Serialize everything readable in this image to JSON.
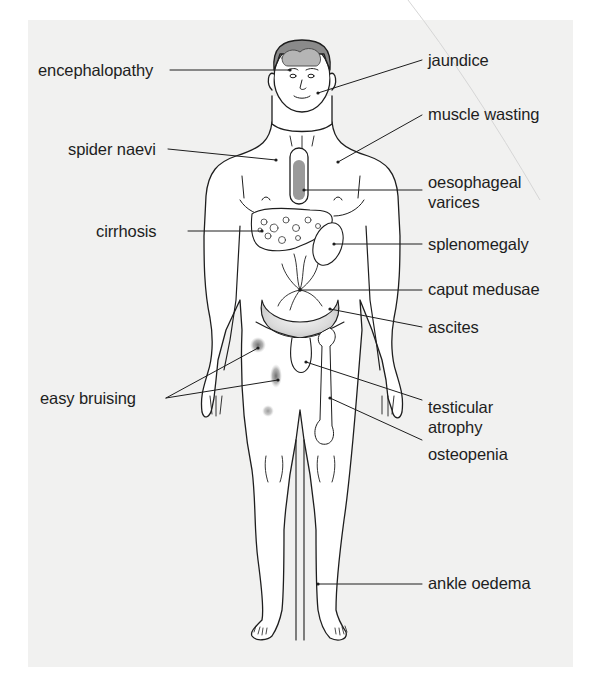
{
  "figure": {
    "colors": {
      "panel_background": "#f1f1f0",
      "page_background": "#ffffff",
      "line": "#1e1e1e",
      "hair": "#8a8a8a",
      "oesophagus_fill": "#9a9a9a",
      "bruise": "#8c8c8c"
    }
  },
  "labels": {
    "left": [
      {
        "id": "encephalopathy",
        "text": "encephalopathy"
      },
      {
        "id": "spider-naevi",
        "text": "spider naevi"
      },
      {
        "id": "cirrhosis",
        "text": "cirrhosis"
      },
      {
        "id": "easy-bruising",
        "text": "easy bruising"
      }
    ],
    "right": [
      {
        "id": "jaundice",
        "text": "jaundice"
      },
      {
        "id": "muscle-wasting",
        "text": "muscle wasting"
      },
      {
        "id": "oesophageal-varices",
        "line1": "oesophageal",
        "line2": "varices"
      },
      {
        "id": "splenomegaly",
        "text": "splenomegaly"
      },
      {
        "id": "caput-medusae",
        "text": "caput medusae"
      },
      {
        "id": "ascites",
        "text": "ascites"
      },
      {
        "id": "testicular-atrophy",
        "line1": "testicular",
        "line2": "atrophy"
      },
      {
        "id": "osteopenia",
        "text": "osteopenia"
      },
      {
        "id": "ankle-oedema",
        "text": "ankle oedema"
      }
    ]
  }
}
